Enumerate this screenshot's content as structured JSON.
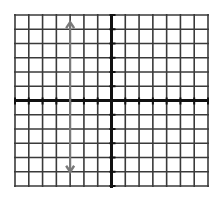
{
  "chart_data": {
    "type": "line",
    "title": "",
    "xlabel": "",
    "ylabel": "",
    "xlim": [
      -7,
      7
    ],
    "ylim": [
      -6,
      6
    ],
    "grid": true,
    "grid_step": 1,
    "legend": "none",
    "series": [
      {
        "name": "vertical line x = -3",
        "style": "double-headed arrow",
        "color": "#7a7a7a",
        "x": [
          -3,
          -3
        ],
        "y": [
          5.5,
          -5
        ]
      }
    ]
  },
  "colors": {
    "background": "#ffffff",
    "grid": "#3a3a3a",
    "axis": "#111111",
    "line": "#7a7a7a"
  },
  "layout": {
    "x0": 15,
    "x1": 208,
    "y0": 15,
    "y1": 186,
    "origin_x": 111.5,
    "origin_y": 100.5
  }
}
